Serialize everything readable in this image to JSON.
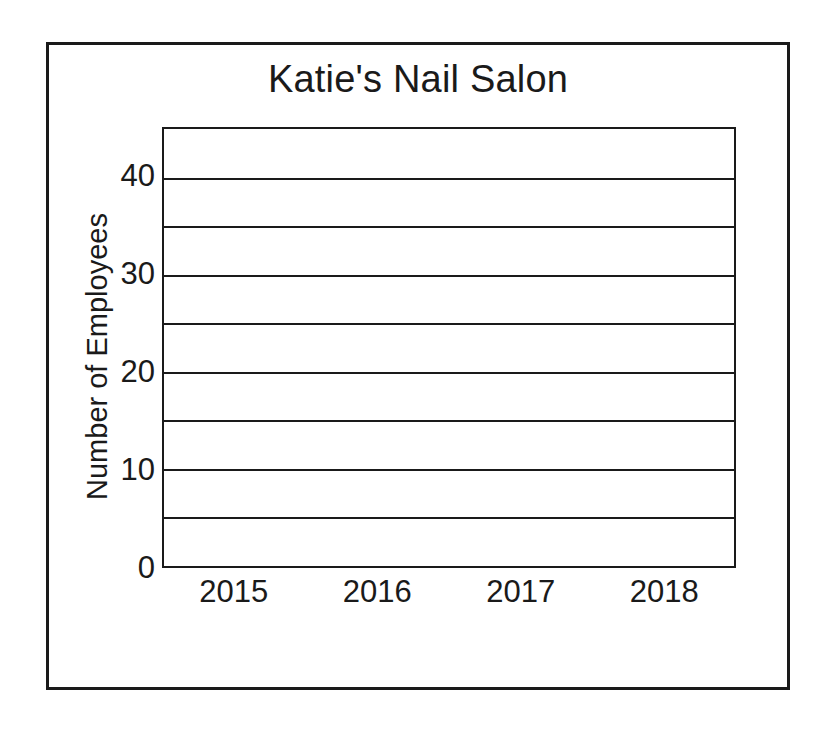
{
  "chart_data": {
    "type": "bar",
    "title": "Katie's Nail Salon",
    "xlabel": "",
    "ylabel": "Number of Employees",
    "categories": [
      "2015",
      "2016",
      "2017",
      "2018"
    ],
    "values": [
      null,
      null,
      null,
      null
    ],
    "series": [
      {
        "name": "Number of Employees",
        "values": [
          null,
          null,
          null,
          null
        ]
      }
    ],
    "ylim": [
      0,
      45
    ],
    "y_tick_step": 5,
    "y_ticks": [
      0,
      5,
      10,
      15,
      20,
      25,
      30,
      35,
      40,
      45
    ],
    "y_tick_labels_shown": [
      "0",
      "10",
      "20",
      "30",
      "40"
    ],
    "gridlines": [
      5,
      10,
      15,
      20,
      25,
      30,
      35,
      40
    ],
    "grid": true,
    "legend": false,
    "legend_position": "none",
    "note": "Blank bar-graph template: axes and gridlines drawn, no bars plotted",
    "colors": {
      "line": "#1a1a1a",
      "background": "#ffffff",
      "text": "#1a1a1a"
    }
  },
  "axis": {
    "y_labels": [
      {
        "value": 40,
        "text": "40"
      },
      {
        "value": 30,
        "text": "30"
      },
      {
        "value": 20,
        "text": "20"
      },
      {
        "value": 10,
        "text": "10"
      },
      {
        "value": 0,
        "text": "0"
      }
    ],
    "x_labels": [
      {
        "text": "2015"
      },
      {
        "text": "2016"
      },
      {
        "text": "2017"
      },
      {
        "text": "2018"
      }
    ]
  }
}
